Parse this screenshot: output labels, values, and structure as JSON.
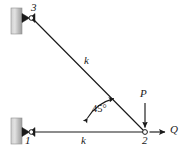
{
  "figure": {
    "type": "structural-truss-diagram",
    "background_color": "#ffffff",
    "line_color": "#1a1a1a",
    "wall_color_light": "#d9d9d9",
    "wall_color_dark": "#a8a8a8",
    "size": {
      "width": 186,
      "height": 152
    }
  },
  "nodes": [
    {
      "id": "node-1",
      "label": "1",
      "x": 26,
      "y": 132,
      "label_x": 25,
      "label_y": 136
    },
    {
      "id": "node-2",
      "label": "2",
      "x": 145,
      "y": 132,
      "label_x": 142,
      "label_y": 136
    },
    {
      "id": "node-3",
      "label": "3",
      "x": 26,
      "y": 18,
      "label_x": 31,
      "label_y": 4
    }
  ],
  "members": [
    {
      "id": "member-diagonal",
      "label": "k",
      "from": "node-3",
      "to": "node-2",
      "label_x": 84,
      "label_y": 57
    },
    {
      "id": "member-horizontal",
      "label": "k",
      "from": "node-1",
      "to": "node-2",
      "label_x": 81,
      "label_y": 136
    }
  ],
  "supports": [
    {
      "id": "support-top",
      "type": "pinned-wall",
      "wall_x": 11,
      "wall_y": 8,
      "wall_w": 11,
      "wall_h": 26
    },
    {
      "id": "support-bottom",
      "type": "pinned-wall",
      "wall_x": 11,
      "wall_y": 118,
      "wall_w": 11,
      "wall_h": 26
    }
  ],
  "loads": [
    {
      "id": "load-P",
      "label": "P",
      "direction": "down",
      "applied_at": "node-2",
      "label_x": 140,
      "label_y": 92,
      "arrow_from": {
        "x": 145,
        "y": 104
      },
      "arrow_to": {
        "x": 145,
        "y": 129
      }
    },
    {
      "id": "load-Q",
      "label": "Q",
      "direction": "right",
      "applied_at": "node-2",
      "label_x": 172,
      "label_y": 126,
      "arrow_from": {
        "x": 150,
        "y": 132
      },
      "arrow_to": {
        "x": 166,
        "y": 132
      }
    }
  ],
  "angle": {
    "id": "angle-45",
    "label": "45°",
    "value": 45,
    "unit": "degrees",
    "label_x": 92,
    "label_y": 107,
    "between": [
      "member-horizontal",
      "member-diagonal"
    ],
    "arc_radius": 43
  }
}
